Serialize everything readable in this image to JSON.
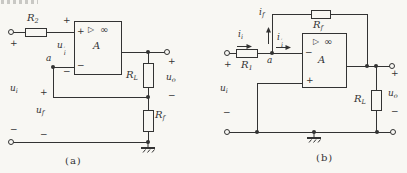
{
  "figure": {
    "captions": {
      "a": "(a)",
      "b": "(b)"
    },
    "paper_color": "#f8f7f3",
    "ink_color": "#333333"
  },
  "symbols": {
    "plus": "+",
    "minus": "−"
  },
  "circuit_a": {
    "opamp": {
      "name": "A",
      "triangle": "▷",
      "infinity": "∞",
      "plus": "+",
      "minus": "−"
    },
    "node": "a",
    "r2": {
      "base": "R",
      "sub": "2"
    },
    "rl": {
      "base": "R",
      "sub": "L"
    },
    "rf": {
      "base": "R",
      "sub": "f"
    },
    "ui": {
      "base": "u",
      "sub": "i"
    },
    "ui_prime": {
      "base": "u",
      "prime": "′",
      "sub": "i"
    },
    "uf": {
      "base": "u",
      "sub": "f"
    },
    "uo": {
      "base": "u",
      "sub": "o"
    }
  },
  "circuit_b": {
    "opamp": {
      "name": "A",
      "triangle": "▷",
      "infinity": "∞",
      "plus": "+",
      "minus": "−"
    },
    "node": "a",
    "r1": {
      "base": "R",
      "sub": "1"
    },
    "rf": {
      "base": "R",
      "sub": "f"
    },
    "rl": {
      "base": "R",
      "sub": "L"
    },
    "ui": {
      "base": "u",
      "sub": "i"
    },
    "uo": {
      "base": "u",
      "sub": "o"
    },
    "ii": {
      "base": "i",
      "sub": "i"
    },
    "if": {
      "base": "i",
      "sub": "f"
    },
    "ii_prime": {
      "base": "i",
      "prime": "′",
      "sub": "i"
    }
  }
}
